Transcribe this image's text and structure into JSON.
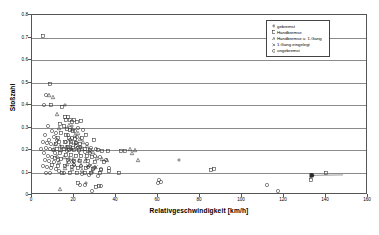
{
  "chart_data": {
    "type": "scatter",
    "title": "",
    "xlabel": "Relativgeschwindigkeit [km/h]",
    "ylabel": "Stoßzahl",
    "xlim": [
      0,
      160
    ],
    "ylim": [
      0,
      0.8
    ],
    "xticks": [
      0,
      20,
      40,
      60,
      80,
      100,
      120,
      140,
      160
    ],
    "yticks": [
      0,
      0.1,
      0.2,
      0.3,
      0.4,
      0.5,
      0.6,
      0.7,
      0.8
    ],
    "ytick_labels": [
      "0",
      "0.1",
      "0.2",
      "0.3",
      "0.4",
      "0.5",
      "0.6",
      "0.7",
      "0.8"
    ],
    "xtick_labels": [
      "0",
      "20",
      "40",
      "60",
      "80",
      "100",
      "120",
      "140",
      "160"
    ],
    "grid": "horizontal",
    "legend_position": "top-right",
    "series": [
      {
        "name": "gebremst",
        "marker": "plus",
        "points": [
          [
            70.0,
            0.155
          ],
          [
            25.5,
            0.053
          ],
          [
            23.5,
            0.215
          ],
          [
            18.5,
            0.205
          ],
          [
            15.5,
            0.4
          ],
          [
            19.0,
            0.305
          ],
          [
            20.5,
            0.225
          ],
          [
            17.0,
            0.215
          ]
        ]
      },
      {
        "name": "Handbremse",
        "marker": "square",
        "points": [
          [
            5.0,
            0.705
          ],
          [
            8.5,
            0.495
          ],
          [
            9.0,
            0.4
          ],
          [
            14.5,
            0.39
          ],
          [
            15.5,
            0.345
          ],
          [
            16.0,
            0.335
          ],
          [
            17.0,
            0.345
          ],
          [
            18.0,
            0.335
          ],
          [
            19.0,
            0.325
          ],
          [
            20.0,
            0.335
          ],
          [
            21.5,
            0.325
          ],
          [
            23.5,
            0.33
          ],
          [
            13.5,
            0.315
          ],
          [
            15.0,
            0.305
          ],
          [
            16.5,
            0.295
          ],
          [
            18.0,
            0.29
          ],
          [
            19.5,
            0.285
          ],
          [
            14.0,
            0.275
          ],
          [
            16.0,
            0.265
          ],
          [
            12.5,
            0.255
          ],
          [
            17.5,
            0.255
          ],
          [
            20.5,
            0.25
          ],
          [
            24.0,
            0.255
          ],
          [
            25.5,
            0.265
          ],
          [
            13.0,
            0.235
          ],
          [
            15.5,
            0.235
          ],
          [
            18.5,
            0.235
          ],
          [
            21.0,
            0.23
          ],
          [
            23.0,
            0.225
          ],
          [
            29.5,
            0.245
          ],
          [
            11.5,
            0.225
          ],
          [
            14.5,
            0.215
          ],
          [
            17.0,
            0.215
          ],
          [
            19.5,
            0.21
          ],
          [
            22.0,
            0.21
          ],
          [
            25.0,
            0.205
          ],
          [
            27.5,
            0.2
          ],
          [
            12.0,
            0.205
          ],
          [
            15.0,
            0.205
          ],
          [
            17.5,
            0.2
          ],
          [
            20.0,
            0.2
          ],
          [
            22.5,
            0.2
          ],
          [
            31.5,
            0.2
          ],
          [
            33.5,
            0.195
          ],
          [
            36.0,
            0.195
          ],
          [
            42.5,
            0.195
          ],
          [
            44.5,
            0.195
          ],
          [
            13.5,
            0.185
          ],
          [
            16.0,
            0.18
          ],
          [
            18.5,
            0.18
          ],
          [
            21.0,
            0.175
          ],
          [
            23.5,
            0.175
          ],
          [
            26.0,
            0.175
          ],
          [
            28.5,
            0.17
          ],
          [
            11.0,
            0.165
          ],
          [
            14.0,
            0.16
          ],
          [
            17.0,
            0.155
          ],
          [
            20.0,
            0.15
          ],
          [
            23.0,
            0.15
          ],
          [
            26.5,
            0.15
          ],
          [
            30.0,
            0.145
          ],
          [
            34.5,
            0.145
          ],
          [
            9.5,
            0.135
          ],
          [
            12.5,
            0.13
          ],
          [
            15.5,
            0.13
          ],
          [
            19.0,
            0.125
          ],
          [
            22.0,
            0.12
          ],
          [
            25.5,
            0.12
          ],
          [
            29.0,
            0.115
          ],
          [
            33.0,
            0.11
          ],
          [
            36.5,
            0.105
          ],
          [
            14.5,
            0.1
          ],
          [
            18.0,
            0.1
          ],
          [
            21.5,
            0.1
          ],
          [
            25.0,
            0.1
          ],
          [
            28.0,
            0.1
          ],
          [
            32.5,
            0.1
          ],
          [
            41.5,
            0.1
          ],
          [
            85.0,
            0.11
          ],
          [
            86.5,
            0.115
          ],
          [
            140.0,
            0.1
          ],
          [
            133.0,
            0.065
          ],
          [
            22.0,
            0.055
          ],
          [
            32.0,
            0.04
          ],
          [
            30.5,
            0.035
          ]
        ]
      },
      {
        "name": "Handbremse u. 1.Gang",
        "marker": "triangle",
        "points": [
          [
            8.0,
            0.445
          ],
          [
            10.0,
            0.435
          ],
          [
            12.0,
            0.36
          ],
          [
            13.0,
            0.3
          ],
          [
            17.5,
            0.31
          ],
          [
            19.0,
            0.295
          ],
          [
            20.5,
            0.265
          ],
          [
            22.0,
            0.275
          ],
          [
            23.0,
            0.25
          ],
          [
            21.0,
            0.235
          ],
          [
            24.5,
            0.235
          ],
          [
            26.0,
            0.22
          ],
          [
            11.0,
            0.225
          ],
          [
            13.5,
            0.22
          ],
          [
            16.0,
            0.215
          ],
          [
            18.5,
            0.21
          ],
          [
            24.0,
            0.205
          ],
          [
            10.5,
            0.205
          ],
          [
            14.0,
            0.2
          ],
          [
            27.0,
            0.195
          ],
          [
            29.0,
            0.19
          ],
          [
            46.5,
            0.205
          ],
          [
            49.0,
            0.2
          ],
          [
            47.5,
            0.185
          ],
          [
            50.5,
            0.155
          ],
          [
            12.0,
            0.175
          ],
          [
            15.0,
            0.17
          ],
          [
            17.5,
            0.165
          ],
          [
            19.5,
            0.16
          ],
          [
            22.5,
            0.155
          ],
          [
            25.0,
            0.15
          ],
          [
            31.0,
            0.165
          ],
          [
            33.5,
            0.16
          ],
          [
            35.5,
            0.155
          ],
          [
            13.0,
            0.145
          ],
          [
            16.5,
            0.14
          ],
          [
            20.0,
            0.14
          ],
          [
            23.5,
            0.135
          ],
          [
            27.0,
            0.135
          ],
          [
            30.0,
            0.125
          ],
          [
            15.5,
            0.12
          ],
          [
            19.0,
            0.115
          ],
          [
            24.0,
            0.11
          ],
          [
            28.5,
            0.105
          ],
          [
            13.5,
            0.025
          ]
        ]
      },
      {
        "name": "1.Gang eingelegt",
        "marker": "cross",
        "points": [
          [
            28.0,
            0.135
          ],
          [
            30.5,
            0.125
          ],
          [
            22.5,
            0.185
          ],
          [
            25.5,
            0.16
          ],
          [
            19.5,
            0.145
          ],
          [
            26.5,
            0.13
          ]
        ]
      },
      {
        "name": "ungebremst",
        "marker": "circle",
        "points": [
          [
            6.5,
            0.445
          ],
          [
            5.5,
            0.4
          ],
          [
            7.5,
            0.305
          ],
          [
            9.5,
            0.285
          ],
          [
            6.0,
            0.265
          ],
          [
            8.0,
            0.245
          ],
          [
            10.5,
            0.26
          ],
          [
            11.5,
            0.275
          ],
          [
            5.0,
            0.235
          ],
          [
            7.0,
            0.23
          ],
          [
            9.0,
            0.225
          ],
          [
            12.0,
            0.245
          ],
          [
            4.5,
            0.205
          ],
          [
            6.5,
            0.21
          ],
          [
            8.5,
            0.205
          ],
          [
            10.0,
            0.2
          ],
          [
            5.5,
            0.185
          ],
          [
            7.5,
            0.175
          ],
          [
            9.5,
            0.17
          ],
          [
            11.0,
            0.185
          ],
          [
            6.0,
            0.155
          ],
          [
            8.0,
            0.15
          ],
          [
            10.5,
            0.145
          ],
          [
            12.5,
            0.155
          ],
          [
            5.0,
            0.13
          ],
          [
            7.0,
            0.125
          ],
          [
            9.0,
            0.12
          ],
          [
            11.5,
            0.115
          ],
          [
            6.5,
            0.1
          ],
          [
            8.5,
            0.1
          ],
          [
            13.0,
            0.105
          ],
          [
            15.0,
            0.1
          ],
          [
            16.5,
            0.195
          ],
          [
            18.0,
            0.245
          ],
          [
            20.5,
            0.285
          ],
          [
            22.0,
            0.3
          ],
          [
            24.5,
            0.29
          ],
          [
            17.0,
            0.265
          ],
          [
            19.0,
            0.255
          ],
          [
            21.5,
            0.26
          ],
          [
            23.0,
            0.215
          ],
          [
            26.0,
            0.225
          ],
          [
            28.0,
            0.21
          ],
          [
            30.5,
            0.205
          ],
          [
            16.0,
            0.235
          ],
          [
            18.5,
            0.225
          ],
          [
            21.0,
            0.22
          ],
          [
            25.0,
            0.19
          ],
          [
            27.5,
            0.185
          ],
          [
            30.0,
            0.175
          ],
          [
            32.5,
            0.17
          ],
          [
            35.0,
            0.155
          ],
          [
            17.5,
            0.145
          ],
          [
            20.0,
            0.135
          ],
          [
            23.5,
            0.13
          ],
          [
            26.5,
            0.125
          ],
          [
            29.5,
            0.12
          ],
          [
            33.0,
            0.115
          ],
          [
            36.5,
            0.12
          ],
          [
            24.0,
            0.095
          ],
          [
            27.0,
            0.09
          ],
          [
            31.5,
            0.085
          ],
          [
            60.5,
            0.065
          ],
          [
            61.5,
            0.06
          ],
          [
            60.0,
            0.055
          ],
          [
            112.0,
            0.045
          ],
          [
            117.0,
            0.02
          ],
          [
            23.0,
            0.045
          ],
          [
            25.0,
            0.045
          ],
          [
            33.0,
            0.04
          ],
          [
            28.5,
            0.02
          ]
        ]
      }
    ]
  },
  "legend": {
    "entries": [
      {
        "label": "gebremst",
        "marker": "plus"
      },
      {
        "label": "Handbremse",
        "marker": "square"
      },
      {
        "label": "Handbremse u. 1.Gang",
        "marker": "triangle"
      },
      {
        "label": "1.Gang eingelegt",
        "marker": "cross"
      },
      {
        "label": "ungebremst",
        "marker": "circle"
      }
    ]
  },
  "colors": {
    "axis": "#555555",
    "grid": "#8a8a8a",
    "marker": "#3a3a3a",
    "background": "#ffffff"
  }
}
